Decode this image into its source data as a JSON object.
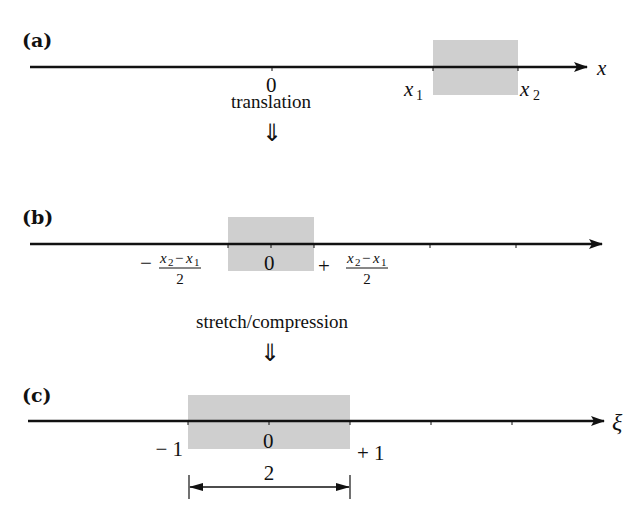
{
  "colors": {
    "axis": "#111111",
    "interval_fill": "#cfcfcf",
    "background": "#ffffff"
  },
  "panel_a": {
    "label": "(a)",
    "axis_label": "x",
    "origin_label": "0",
    "left_endpoint_var": "x",
    "left_endpoint_sub": "1",
    "right_endpoint_var": "x",
    "right_endpoint_sub": "2"
  },
  "step_1": {
    "caption": "translation",
    "arrow": "⇓"
  },
  "panel_b": {
    "label": "(b)",
    "origin_label": "0",
    "left_sign": "−",
    "right_sign": "+",
    "fraction_numerator": {
      "var1": "x",
      "sub1": "2",
      "minus": "−",
      "var2": "x",
      "sub2": "1"
    },
    "fraction_denominator": "2"
  },
  "step_2": {
    "caption": "stretch/compression",
    "arrow": "⇓"
  },
  "panel_c": {
    "label": "(c)",
    "axis_label": "ξ",
    "origin_label": "0",
    "left_endpoint": "− 1",
    "right_endpoint": "+ 1",
    "width_label": "2"
  }
}
